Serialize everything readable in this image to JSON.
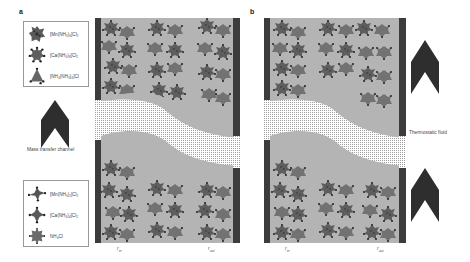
{
  "panels": {
    "a": {
      "label": "a",
      "legend_top": {
        "items": [
          {
            "icon": "mn-complex-icon",
            "label": "[Mn(NH₃)₆]Cl₂"
          },
          {
            "icon": "ca-complex-icon",
            "label": "[Ca(NH₃)₈]Cl₂"
          },
          {
            "icon": "nh4-complex-icon",
            "label": "[NH₄(NH₃)₄]Cl"
          }
        ]
      },
      "arrow_caption": "Mass transfer channel",
      "legend_bottom": {
        "items": [
          {
            "icon": "mn-complex-icon",
            "label": "[Mn(NH₃)₂]Cl₂"
          },
          {
            "icon": "ca-complex-icon",
            "label": "[Ca(NH₃)₄]Cl₂"
          },
          {
            "icon": "nh4cl-icon",
            "label": "NH₄Cl"
          }
        ]
      },
      "r_in": "r",
      "r_in_sub": "in",
      "r_out": "r",
      "r_out_sub": "out"
    },
    "b": {
      "label": "b",
      "side_caption": "Thermostatic fluid",
      "r_in": "r",
      "r_in_sub": "in",
      "r_out": "r",
      "r_out_sub": "out"
    }
  },
  "colors": {
    "reactor_bg": "#b4b4b4",
    "wall": "#3c3c3c",
    "crystal_dark": "#555555",
    "crystal_mid": "#6e6e6e",
    "arrow": "#2e2e2e",
    "mesh": "#9a9a9a"
  }
}
